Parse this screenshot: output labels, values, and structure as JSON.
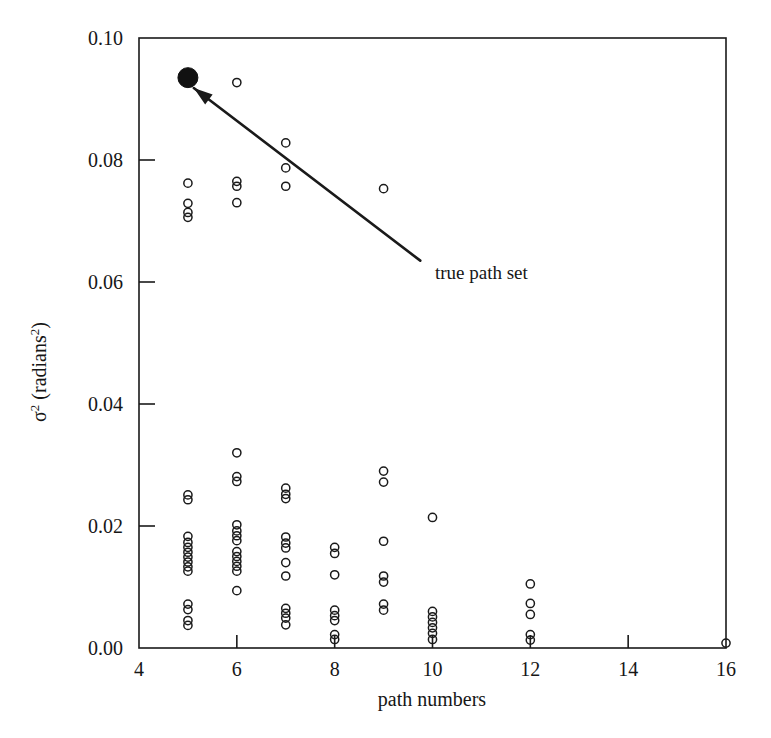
{
  "chart_data": {
    "type": "scatter",
    "title": "",
    "xlabel": "path numbers",
    "ylabel_main": "σ",
    "ylabel_exp": "2",
    "ylabel_unit": " (radians",
    "ylabel_unit_exp": "2",
    "ylabel_close": ")",
    "ylabel_full": "σ² (radians²)",
    "xlim": [
      4,
      16
    ],
    "ylim": [
      0.0,
      0.1
    ],
    "xticks": [
      4,
      6,
      8,
      10,
      12,
      14,
      16
    ],
    "xtick_labels": [
      "4",
      "6",
      "8",
      "10",
      "12",
      "14",
      "16"
    ],
    "yticks": [
      0.0,
      0.02,
      0.04,
      0.06,
      0.08,
      0.1
    ],
    "ytick_labels": [
      "0.00",
      "0.02",
      "0.04",
      "0.06",
      "0.08",
      "0.10"
    ],
    "grid": false,
    "legend": false,
    "marker_style": "open-circle",
    "marker_color": "#111111",
    "annotations": [
      {
        "text": "true path set",
        "text_x": 10.05,
        "text_y": 0.0605,
        "arrow_from_x": 9.75,
        "arrow_from_y": 0.0635,
        "arrow_to_x": 5.12,
        "arrow_to_y": 0.0918
      }
    ],
    "series": [
      {
        "name": "true path set",
        "marker": "filled-circle",
        "points": [
          {
            "x": 5.0,
            "y": 0.0935
          }
        ]
      },
      {
        "name": "estimated path sets",
        "marker": "open-circle",
        "points": [
          {
            "x": 6.0,
            "y": 0.0927
          },
          {
            "x": 7.0,
            "y": 0.0828
          },
          {
            "x": 7.0,
            "y": 0.0787
          },
          {
            "x": 7.0,
            "y": 0.0757
          },
          {
            "x": 9.0,
            "y": 0.0753
          },
          {
            "x": 5.0,
            "y": 0.0762
          },
          {
            "x": 5.0,
            "y": 0.0729
          },
          {
            "x": 5.0,
            "y": 0.0714
          },
          {
            "x": 5.0,
            "y": 0.0706
          },
          {
            "x": 6.0,
            "y": 0.0765
          },
          {
            "x": 6.0,
            "y": 0.0757
          },
          {
            "x": 6.0,
            "y": 0.073
          },
          {
            "x": 6.0,
            "y": 0.032
          },
          {
            "x": 6.0,
            "y": 0.0281
          },
          {
            "x": 6.0,
            "y": 0.0273
          },
          {
            "x": 5.0,
            "y": 0.0251
          },
          {
            "x": 5.0,
            "y": 0.0243
          },
          {
            "x": 7.0,
            "y": 0.0262
          },
          {
            "x": 7.0,
            "y": 0.0252
          },
          {
            "x": 7.0,
            "y": 0.0245
          },
          {
            "x": 9.0,
            "y": 0.029
          },
          {
            "x": 9.0,
            "y": 0.0272
          },
          {
            "x": 10.0,
            "y": 0.0214
          },
          {
            "x": 5.0,
            "y": 0.0183
          },
          {
            "x": 5.0,
            "y": 0.0173
          },
          {
            "x": 5.0,
            "y": 0.0165
          },
          {
            "x": 5.0,
            "y": 0.0157
          },
          {
            "x": 5.0,
            "y": 0.0149
          },
          {
            "x": 5.0,
            "y": 0.0141
          },
          {
            "x": 5.0,
            "y": 0.0133
          },
          {
            "x": 5.0,
            "y": 0.0126
          },
          {
            "x": 6.0,
            "y": 0.0202
          },
          {
            "x": 6.0,
            "y": 0.0192
          },
          {
            "x": 6.0,
            "y": 0.0184
          },
          {
            "x": 6.0,
            "y": 0.0176
          },
          {
            "x": 6.0,
            "y": 0.0158
          },
          {
            "x": 6.0,
            "y": 0.015
          },
          {
            "x": 6.0,
            "y": 0.0142
          },
          {
            "x": 6.0,
            "y": 0.0134
          },
          {
            "x": 6.0,
            "y": 0.0126
          },
          {
            "x": 6.0,
            "y": 0.0094
          },
          {
            "x": 7.0,
            "y": 0.0182
          },
          {
            "x": 7.0,
            "y": 0.0172
          },
          {
            "x": 7.0,
            "y": 0.0164
          },
          {
            "x": 7.0,
            "y": 0.014
          },
          {
            "x": 7.0,
            "y": 0.0118
          },
          {
            "x": 8.0,
            "y": 0.0165
          },
          {
            "x": 8.0,
            "y": 0.0155
          },
          {
            "x": 8.0,
            "y": 0.012
          },
          {
            "x": 9.0,
            "y": 0.0175
          },
          {
            "x": 9.0,
            "y": 0.0118
          },
          {
            "x": 9.0,
            "y": 0.0108
          },
          {
            "x": 5.0,
            "y": 0.0072
          },
          {
            "x": 5.0,
            "y": 0.0063
          },
          {
            "x": 5.0,
            "y": 0.0045
          },
          {
            "x": 5.0,
            "y": 0.0037
          },
          {
            "x": 7.0,
            "y": 0.0065
          },
          {
            "x": 7.0,
            "y": 0.0057
          },
          {
            "x": 7.0,
            "y": 0.0049
          },
          {
            "x": 7.0,
            "y": 0.0038
          },
          {
            "x": 8.0,
            "y": 0.0062
          },
          {
            "x": 8.0,
            "y": 0.0053
          },
          {
            "x": 8.0,
            "y": 0.0045
          },
          {
            "x": 8.0,
            "y": 0.0022
          },
          {
            "x": 8.0,
            "y": 0.0014
          },
          {
            "x": 9.0,
            "y": 0.0072
          },
          {
            "x": 9.0,
            "y": 0.0062
          },
          {
            "x": 10.0,
            "y": 0.006
          },
          {
            "x": 10.0,
            "y": 0.0051
          },
          {
            "x": 10.0,
            "y": 0.0042
          },
          {
            "x": 10.0,
            "y": 0.0033
          },
          {
            "x": 10.0,
            "y": 0.0024
          },
          {
            "x": 10.0,
            "y": 0.0014
          },
          {
            "x": 12.0,
            "y": 0.0105
          },
          {
            "x": 12.0,
            "y": 0.0073
          },
          {
            "x": 12.0,
            "y": 0.0055
          },
          {
            "x": 12.0,
            "y": 0.0022
          },
          {
            "x": 12.0,
            "y": 0.0013
          },
          {
            "x": 16.0,
            "y": 0.0008
          }
        ]
      }
    ]
  }
}
